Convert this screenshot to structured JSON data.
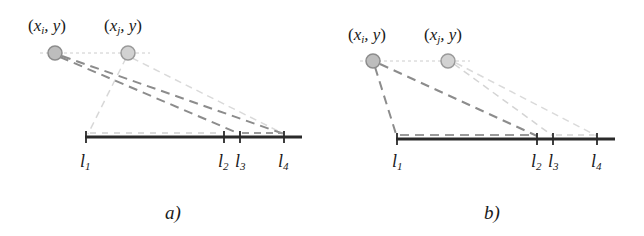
{
  "panels": [
    {
      "id": "a",
      "caption": "a)",
      "points": [
        {
          "label_var": "x",
          "label_sub": "i",
          "label_tail": ", y",
          "cx": 55,
          "cy": 53
        },
        {
          "label_var": "x",
          "label_sub": "j",
          "label_tail": ", y",
          "cx": 128,
          "cy": 53
        }
      ],
      "axis": {
        "y": 137,
        "x1": 85,
        "x2": 302
      },
      "ticks": [
        {
          "name": "l",
          "sub": "1",
          "x": 86
        },
        {
          "name": "l",
          "sub": "2",
          "x": 224
        },
        {
          "name": "l",
          "sub": "3",
          "x": 240
        },
        {
          "name": "l",
          "sub": "4",
          "x": 284
        }
      ]
    },
    {
      "id": "b",
      "caption": "b)",
      "points": [
        {
          "label_var": "x",
          "label_sub": "i",
          "label_tail": ", y",
          "cx": 373,
          "cy": 61
        },
        {
          "label_var": "x",
          "label_sub": "j",
          "label_tail": ", y",
          "cx": 448,
          "cy": 61
        }
      ],
      "axis": {
        "y": 139,
        "x1": 396,
        "x2": 615
      },
      "ticks": [
        {
          "name": "l",
          "sub": "1",
          "x": 397
        },
        {
          "name": "l",
          "sub": "2",
          "x": 537
        },
        {
          "name": "l",
          "sub": "3",
          "x": 553
        },
        {
          "name": "l",
          "sub": "4",
          "x": 597
        }
      ]
    }
  ],
  "colors": {
    "axis": "#2a2a2a",
    "dark_dash": "#8a8a8a",
    "light_dash": "#cfcfcf",
    "guide": "#c8c8c8",
    "point_fill": "#bdbdbd",
    "point_stroke": "#8c8c8c"
  }
}
